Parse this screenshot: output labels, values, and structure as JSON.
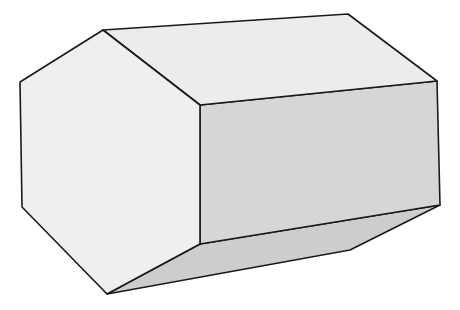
{
  "figure": {
    "colors": {
      "background": "#ffffff",
      "end_face": "#efefef",
      "top_face": "#ececec",
      "front_face": "#d6d6d6",
      "bottom_face": "#cdcdcd",
      "edge": "#1a1a1a"
    },
    "faces": {
      "end_face": "103,30 20,82 22,207 107,294 200,244 200,105",
      "top_face": "103,30 348,14 437,81 200,105",
      "front_face": "200,105 437,81 440,205 200,244",
      "bottom_face": "107,294 200,244 440,205 350,250"
    }
  }
}
